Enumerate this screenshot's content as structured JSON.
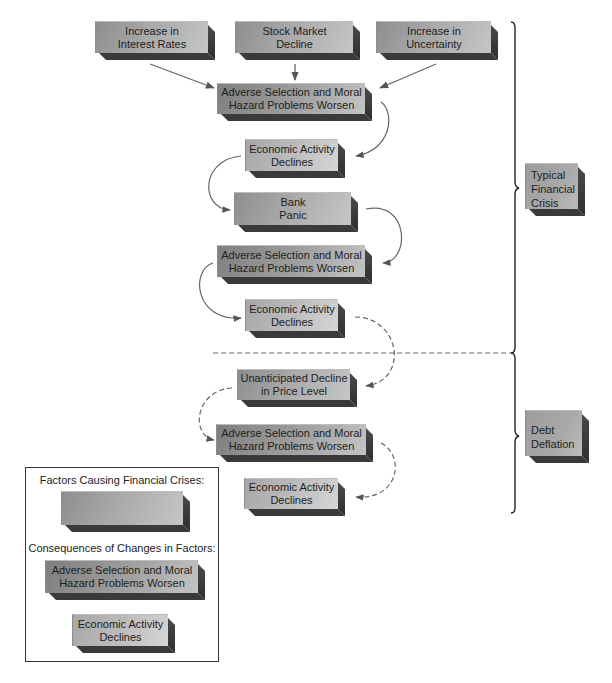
{
  "diagram": {
    "factors": [
      {
        "id": "interest",
        "label": "Increase in Interest Rates",
        "lines": [
          "Increase in",
          "Interest Rates"
        ]
      },
      {
        "id": "stock",
        "label": "Stock Market Decline",
        "lines": [
          "Stock Market",
          "Decline"
        ]
      },
      {
        "id": "uncertainty",
        "label": "Increase in Uncertainty",
        "lines": [
          "Increase in",
          "Uncertainty"
        ]
      }
    ],
    "flow": [
      {
        "id": "asmh1",
        "type": "consequence-a",
        "lines": [
          "Adverse Selection and Moral",
          "Hazard Problems Worsen"
        ]
      },
      {
        "id": "ead1",
        "type": "consequence-b",
        "lines": [
          "Economic Activity",
          "Declines"
        ]
      },
      {
        "id": "bank",
        "type": "factor",
        "lines": [
          "Bank",
          "Panic"
        ]
      },
      {
        "id": "asmh2",
        "type": "consequence-a",
        "lines": [
          "Adverse Selection and Moral",
          "Hazard Problems Worsen"
        ]
      },
      {
        "id": "ead2",
        "type": "consequence-b",
        "lines": [
          "Economic Activity",
          "Declines"
        ]
      },
      {
        "id": "udpl",
        "type": "factor",
        "lines": [
          "Unanticipated Decline",
          "in Price Level"
        ]
      },
      {
        "id": "asmh3",
        "type": "consequence-a",
        "lines": [
          "Adverse Selection and Moral",
          "Hazard Problems Worsen"
        ]
      },
      {
        "id": "ead3",
        "type": "consequence-b",
        "lines": [
          "Economic Activity",
          "Declines"
        ]
      }
    ],
    "stages": [
      {
        "id": "typical",
        "lines": [
          "Typical",
          "Financial",
          "Crisis"
        ]
      },
      {
        "id": "debt",
        "lines": [
          "Debt",
          "Deflation"
        ]
      }
    ]
  },
  "legend": {
    "factors_title": "Factors Causing Financial Crises:",
    "consequences_title": "Consequences of Changes in Factors:",
    "sample_a": [
      "Adverse Selection and Moral",
      "Hazard Problems Worsen"
    ],
    "sample_b": [
      "Economic Activity",
      "Declines"
    ]
  }
}
